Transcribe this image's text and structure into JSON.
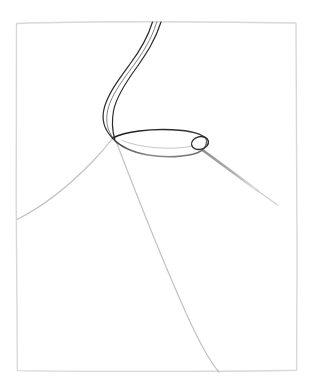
{
  "canvas": {
    "width": 310,
    "height": 381,
    "background": "#ffffff",
    "title": "Needle and thread passing through fabric"
  },
  "palette": {
    "frame": "#d8d8d8",
    "fabric_line": "#c2c2c2",
    "needle_shaft": "#a8a8a8",
    "needle_outline_dark": "#2a2a2a",
    "needle_outline_light": "#6e6e6e",
    "thread": "#2b2b2b"
  },
  "frame": {
    "label": "page-frame",
    "x": 16,
    "y": 22,
    "width": 281,
    "height": 349,
    "stroke": "#d8d8d8",
    "stroke_width": 1.4
  },
  "shapes": {
    "fabric_fold_left": {
      "label": "fabric-fold-left-edge",
      "path": "M 17 219 C 45 205 82 172 112 139",
      "stroke": "#c2c2c2",
      "stroke_width": 1.2
    },
    "fabric_fold_center": {
      "label": "fabric-fold-center-edge",
      "path": "M 117 143 C 140 200 182 300 219 371",
      "stroke": "#c2c2c2",
      "stroke_width": 1.2
    },
    "needle_shaft": {
      "label": "needle-shaft-right",
      "path": "M 203 150 L 277 205",
      "stroke": "#a8a8a8",
      "stroke_width_start": 2.6,
      "stroke_width_end": 0.6
    },
    "needle_body": {
      "label": "needle-body",
      "path": "M 113 138 C 130 131 168 130 191 133 C 203 135 208 141 206 146 C 203 153 186 157 163 156 C 140 155 122 148 113 138 Z",
      "stroke_top": "#2a2a2a",
      "stroke_bottom": "#7a7a7a",
      "stroke_width": 1.3,
      "fill": "#ffffff"
    },
    "needle_eye": {
      "label": "needle-eye",
      "cx": 200,
      "cy": 143,
      "rx": 8,
      "ry": 6,
      "rotation": -12,
      "stroke": "#2a2a2a"
    },
    "thread_strand_a": {
      "label": "thread-strand-outer",
      "path": "M 153 22 C 146 46 133 60 122 76 C 110 94 103 112 107 126 C 109 133 111 136 113 138",
      "stroke": "#2b2b2b",
      "stroke_width": 1.2
    },
    "thread_strand_b": {
      "label": "thread-strand-inner",
      "path": "M 161 22 C 154 45 140 58 130 72 C 117 90 111 110 114 126 C 115 132 115 136 115 139",
      "stroke": "#2b2b2b",
      "stroke_width": 1.2
    },
    "thread_strand_c": {
      "label": "thread-strand-highlight",
      "path": "M 157 22 C 150 45 137 59 126 74 C 113 92 107 111 110 126 C 112 133 113 137 114 139",
      "stroke": "#4a4a4a",
      "stroke_width": 0.7
    }
  },
  "elements": [
    {
      "name": "page-frame",
      "label": "Page frame"
    },
    {
      "name": "fabric-fold-left-edge",
      "label": "Left fabric fold edge"
    },
    {
      "name": "fabric-fold-center-edge",
      "label": "Center fabric fold edge"
    },
    {
      "name": "needle-shaft-right",
      "label": "Needle shaft"
    },
    {
      "name": "needle-body",
      "label": "Needle body"
    },
    {
      "name": "needle-eye",
      "label": "Needle eye"
    },
    {
      "name": "thread-strand-outer",
      "label": "Thread strand (outer)"
    },
    {
      "name": "thread-strand-inner",
      "label": "Thread strand (inner)"
    }
  ]
}
